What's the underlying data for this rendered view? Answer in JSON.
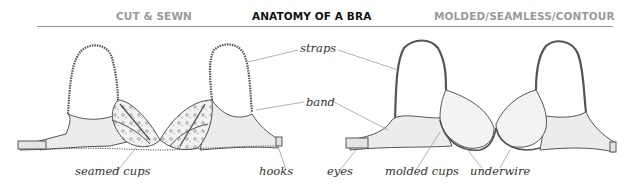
{
  "header": {
    "left_label": "CUT & SEWN",
    "title": "ANATOMY OF A BRA",
    "right_label": "MOLDED/SEAMLESS/CONTOUR"
  },
  "colors": {
    "title_text": "#111111",
    "subtitle_text": "#9a9a9a",
    "rule": "#9a9a9a",
    "leader_lines": "#a0a0a0",
    "illustration_stroke": "#555555",
    "fabric_fill": "#ececec"
  },
  "labels": {
    "straps": "straps",
    "band": "band",
    "seamed_cups": "seamed cups",
    "hooks": "hooks",
    "eyes": "eyes",
    "molded_cups": "molded cups",
    "underwire": "underwire"
  },
  "illustrations": [
    {
      "name": "cut-and-sewn-bra",
      "style": "lace seamed cups"
    },
    {
      "name": "molded-bra",
      "style": "smooth molded cups"
    }
  ]
}
